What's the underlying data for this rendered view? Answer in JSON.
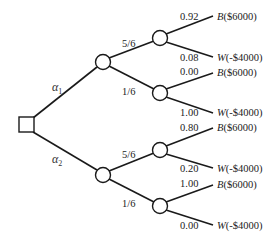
{
  "diagram": {
    "type": "decision-tree",
    "decision_node": {
      "label": ""
    },
    "actions": [
      {
        "name": "α",
        "subscript": "1",
        "branches": [
          {
            "prob_label": "5/6",
            "outcomes": [
              {
                "prob": "0.92",
                "letter": "B",
                "payoff": "($6000)"
              },
              {
                "prob": "0.08",
                "letter": "W",
                "payoff": "(-$4000)"
              }
            ]
          },
          {
            "prob_label": "1/6",
            "outcomes": [
              {
                "prob": "0.00",
                "letter": "B",
                "payoff": "($6000)"
              },
              {
                "prob": "1.00",
                "letter": "W",
                "payoff": "(-$4000)"
              }
            ]
          }
        ]
      },
      {
        "name": "α",
        "subscript": "2",
        "branches": [
          {
            "prob_label": "5/6",
            "outcomes": [
              {
                "prob": "0.80",
                "letter": "B",
                "payoff": "($6000)"
              },
              {
                "prob": "0.20",
                "letter": "W",
                "payoff": "(-$4000)"
              }
            ]
          },
          {
            "prob_label": "1/6",
            "outcomes": [
              {
                "prob": "1.00",
                "letter": "B",
                "payoff": "($6000)"
              },
              {
                "prob": "0.00",
                "letter": "W",
                "payoff": "(-$4000)"
              }
            ]
          }
        ]
      }
    ]
  }
}
